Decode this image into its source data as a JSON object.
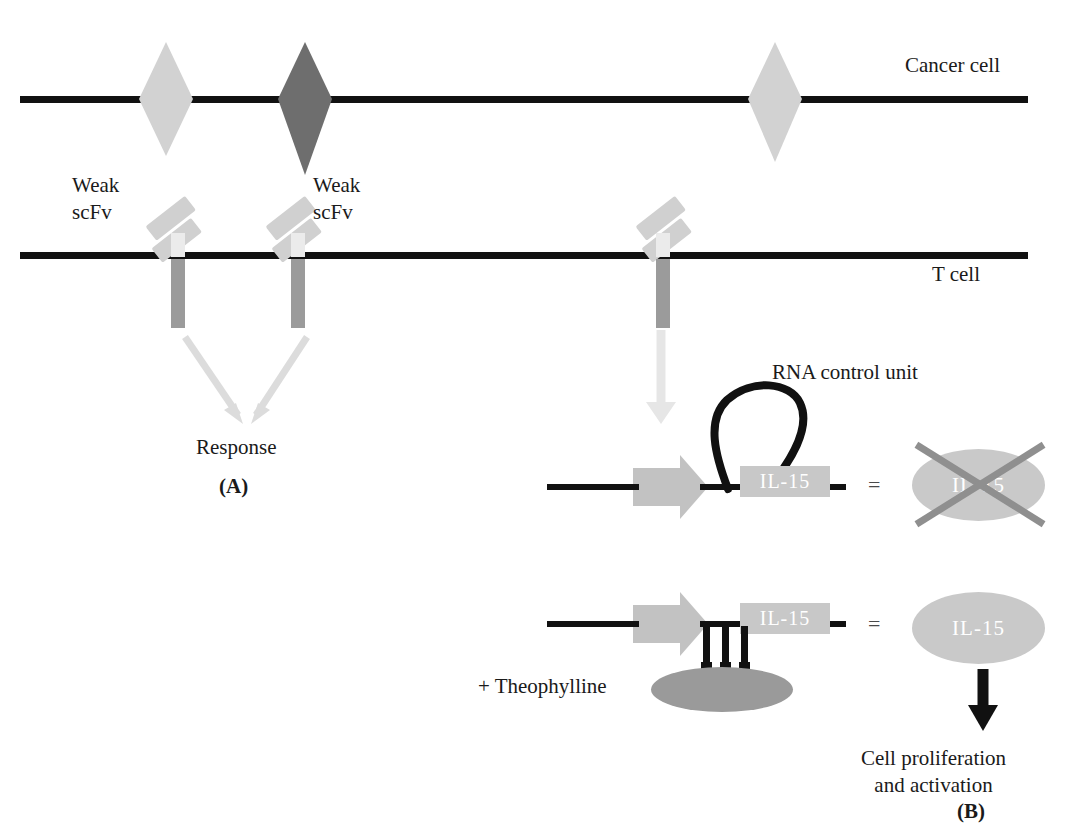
{
  "figure": {
    "title_a": "(A)",
    "title_b": "(B)"
  },
  "labels": {
    "cancer_cell": "Cancer cell",
    "t_cell": "T cell",
    "weak_scfv_left": "Weak\nscFv",
    "weak_scfv_mid": "Weak\nscFv",
    "response": "Response",
    "rna_control_unit": "RNA control unit",
    "theophylline": "+ Theophylline",
    "cell_proliferation": "Cell proliferation\nand activation",
    "panel_a": "(A)",
    "panel_b": "(B)"
  },
  "gene_constructs": [
    {
      "id": "construct-off",
      "il15_label": "IL-15",
      "state": "rna-loop-closed",
      "equals": "=",
      "product_label": "IL-15",
      "product_crossed_out": true
    },
    {
      "id": "construct-on",
      "il15_label": "IL-15",
      "state": "rna-loop-open",
      "equals": "=",
      "product_label": "IL-15",
      "product_crossed_out": false
    }
  ],
  "colors": {
    "membrane": "#111111",
    "antigen_light": "#d2d2d2",
    "antigen_dark": "#6e6e6e",
    "antigen_third": "#d2d2d2",
    "scfv_arm": "#d0d0d0",
    "car_tail": "#9b9b9b",
    "arrow_light": "#dcdcdc",
    "arrow_dark": "#111111",
    "il15_box": "#c8c8c8",
    "il15_oval": "#c9c9c9",
    "theophylline_oval": "#9a9a9a",
    "cross": "#8f8f8f",
    "text": "#1a1a1a"
  }
}
